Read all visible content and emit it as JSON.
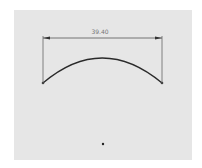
{
  "sketch": {
    "dimension": {
      "label": "39.40",
      "line": {
        "x1": 43,
        "x2": 162,
        "y": 38
      }
    },
    "arc": {
      "start": {
        "x": 43,
        "y": 83
      },
      "apex": {
        "x": 102,
        "y": 58
      },
      "end": {
        "x": 162,
        "y": 83
      }
    },
    "origin_point": {
      "x": 103,
      "y": 144
    },
    "colors": {
      "background": "#e6e6e6",
      "line": "#2a2a2a",
      "dimension": "#555555"
    }
  }
}
